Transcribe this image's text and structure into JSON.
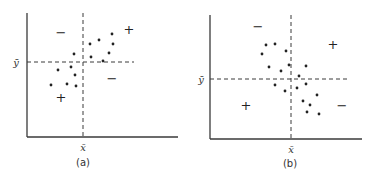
{
  "figure": {
    "panels": [
      {
        "caption": "(a)",
        "x_label": "x̄",
        "y_label": "ȳ",
        "quadrant_signs": {
          "top_left": "−",
          "top_right": "+",
          "bottom_left": "+",
          "bottom_right": "−"
        },
        "description": "Positive association: points clustered along rising diagonal"
      },
      {
        "caption": "(b)",
        "x_label": "x̄",
        "y_label": "ȳ",
        "quadrant_signs": {
          "top_left": "−",
          "top_right": "+",
          "bottom_left": "+",
          "bottom_right": "−"
        },
        "description": "Negative association: points clustered along falling diagonal"
      }
    ]
  },
  "colors": {
    "ink": "#222222",
    "background": "#ffffff"
  },
  "chart_data": [
    {
      "type": "scatter",
      "title": "(a)",
      "xlabel": "x̄",
      "ylabel": "ȳ",
      "mean_lines": {
        "x_mean": 83,
        "y_mean": 62
      },
      "points_px": [
        [
          90,
          44
        ],
        [
          99,
          40
        ],
        [
          112,
          34
        ],
        [
          113,
          44
        ],
        [
          74,
          54
        ],
        [
          91,
          57
        ],
        [
          109,
          53
        ],
        [
          103,
          61
        ],
        [
          58,
          70
        ],
        [
          71,
          67
        ],
        [
          75,
          75
        ],
        [
          51,
          85
        ],
        [
          67,
          84
        ],
        [
          76,
          86
        ]
      ],
      "annotations": [
        {
          "text": "−",
          "x": 61,
          "y": 32
        },
        {
          "text": "+",
          "x": 129,
          "y": 29
        },
        {
          "text": "−",
          "x": 112,
          "y": 78
        },
        {
          "text": "+",
          "x": 61,
          "y": 97
        }
      ]
    },
    {
      "type": "scatter",
      "title": "(b)",
      "xlabel": "x̄",
      "ylabel": "ȳ",
      "mean_lines": {
        "x_mean": 291,
        "y_mean": 79
      },
      "points_px": [
        [
          266,
          45
        ],
        [
          275,
          44
        ],
        [
          262,
          54
        ],
        [
          286,
          51
        ],
        [
          269,
          67
        ],
        [
          289,
          65
        ],
        [
          306,
          66
        ],
        [
          281,
          71
        ],
        [
          299,
          76
        ],
        [
          275,
          85
        ],
        [
          297,
          88
        ],
        [
          306,
          84
        ],
        [
          285,
          91
        ],
        [
          317,
          95
        ],
        [
          303,
          101
        ],
        [
          310,
          105
        ],
        [
          307,
          112
        ],
        [
          319,
          114
        ]
      ],
      "annotations": [
        {
          "text": "−",
          "x": 258,
          "y": 26
        },
        {
          "text": "+",
          "x": 333,
          "y": 44
        },
        {
          "text": "+",
          "x": 246,
          "y": 105
        },
        {
          "text": "−",
          "x": 342,
          "y": 105
        }
      ]
    }
  ]
}
